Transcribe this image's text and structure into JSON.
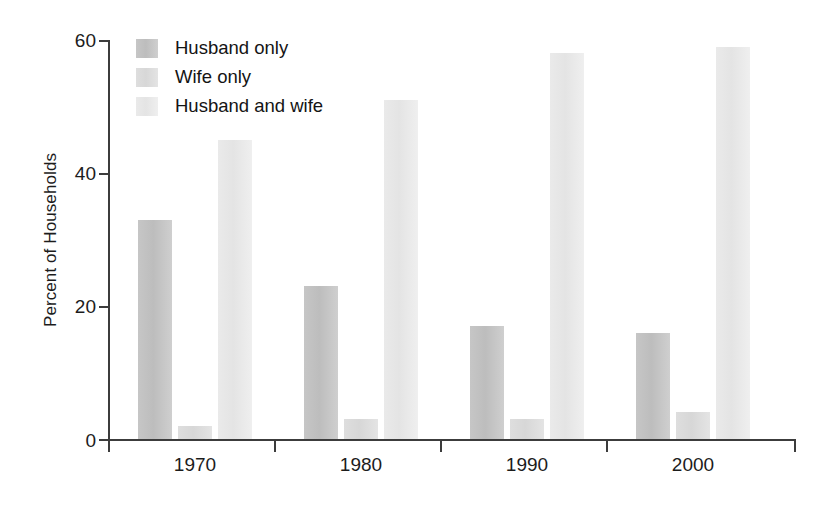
{
  "chart_data": {
    "type": "bar",
    "title": "",
    "xlabel": "",
    "ylabel": "Percent of Households",
    "categories": [
      "1970",
      "1980",
      "1990",
      "2000"
    ],
    "ylim": [
      0,
      60
    ],
    "yticks": [
      0,
      20,
      40,
      60
    ],
    "ytick_labels": [
      "0",
      "20",
      "40",
      "60"
    ],
    "grid": false,
    "legend_position": "top-left",
    "series": [
      {
        "name": "Husband only",
        "color": "#c4c4c4",
        "values": [
          33,
          23,
          17,
          16
        ]
      },
      {
        "name": "Wife only",
        "color": "#dcdcdc",
        "values": [
          2,
          3,
          3,
          4
        ]
      },
      {
        "name": "Husband and wife",
        "color": "#e9e9e9",
        "values": [
          45,
          51,
          58,
          59
        ]
      }
    ]
  }
}
